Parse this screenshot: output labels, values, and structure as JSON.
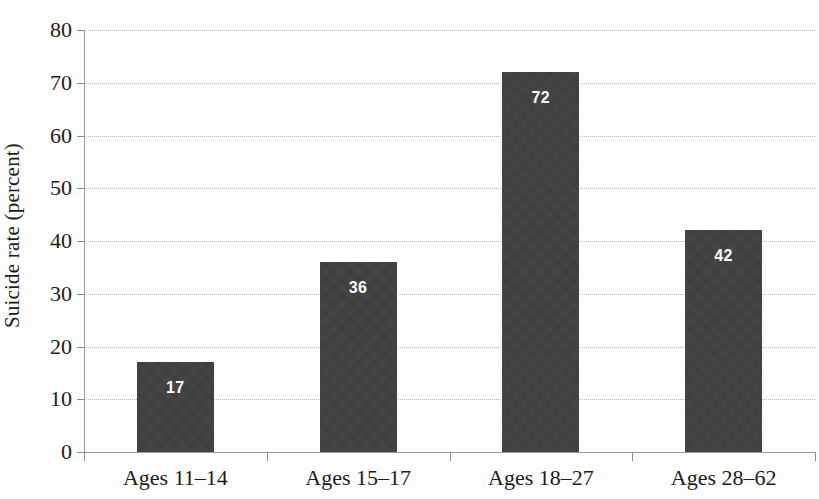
{
  "chart_data": {
    "type": "bar",
    "title": "",
    "subtitle": "",
    "xlabel": "",
    "ylabel": "Suicide rate (percent)",
    "categories": [
      "Ages 11–14",
      "Ages 15–17",
      "Ages 18–27",
      "Ages 28–62"
    ],
    "values": [
      17,
      36,
      72,
      42
    ],
    "data_labels": [
      "17",
      "36",
      "72",
      "42"
    ],
    "ylim": [
      0,
      80
    ],
    "ytick_values": [
      0,
      10,
      20,
      30,
      40,
      50,
      60,
      70,
      80
    ],
    "ytick_labels": [
      "0",
      "10",
      "20",
      "30",
      "40",
      "50",
      "60",
      "70",
      "80"
    ],
    "ytick_interval": 10,
    "grid": "horizontal-dotted",
    "legend": "none",
    "bar_color": "#3a3a3a",
    "data_label_color": "#ffffff",
    "gridline_color": "#b9b9b9",
    "axis_color": "#9a9a9a",
    "text_color": "#1c1c1c",
    "background_color": "#fdfdfd"
  },
  "axis": {
    "y_title": "Suicide rate (percent)"
  },
  "series": [
    {
      "category": "Ages 11–14",
      "value": 17,
      "label": "17"
    },
    {
      "category": "Ages 15–17",
      "value": 36,
      "label": "36"
    },
    {
      "category": "Ages 18–27",
      "value": 72,
      "label": "72"
    },
    {
      "category": "Ages 28–62",
      "value": 42,
      "label": "42"
    }
  ]
}
